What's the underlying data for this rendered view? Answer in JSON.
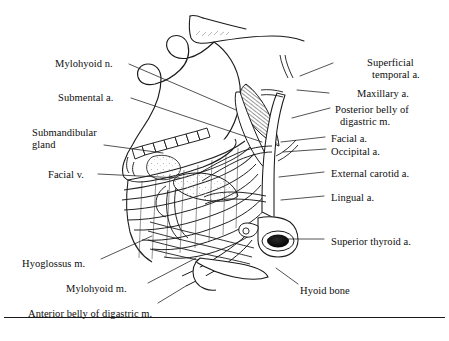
{
  "figure": {
    "kind": "anatomical-line-drawing",
    "region": "Submandibular and suprahyoid region, lateral view",
    "ink_color": "#101010",
    "background_color": "#ffffff"
  },
  "labels": {
    "left": [
      {
        "id": "mylohyoid-n",
        "text": "Mylohyoid n.",
        "x": 55,
        "y": 58,
        "lead": [
          [
            129,
            64
          ],
          [
            236,
            110
          ]
        ]
      },
      {
        "id": "submental-a",
        "text": "Submental a.",
        "x": 58,
        "y": 92,
        "lead": [
          [
            131,
            98
          ],
          [
            262,
            142
          ]
        ]
      },
      {
        "id": "submandibular-gland-l1",
        "text": "Submandibular",
        "x": 32,
        "y": 127,
        "lead": null
      },
      {
        "id": "submandibular-gland-l2",
        "text": "gland",
        "x": 32,
        "y": 139,
        "lead": [
          [
            104,
            145
          ],
          [
            163,
            153
          ]
        ]
      },
      {
        "id": "facial-v",
        "text": "Facial v.",
        "x": 48,
        "y": 169,
        "lead": [
          [
            98,
            174
          ],
          [
            180,
            178
          ]
        ]
      },
      {
        "id": "hyoglossus-m",
        "text": "Hyoglossus m.",
        "x": 22,
        "y": 258,
        "lead": [
          [
            101,
            259
          ],
          [
            152,
            236
          ]
        ]
      },
      {
        "id": "mylohyoid-m",
        "text": "Mylohyoid m.",
        "x": 66,
        "y": 283,
        "lead": [
          [
            148,
            283
          ],
          [
            196,
            258
          ]
        ]
      },
      {
        "id": "anterior-belly-digastric",
        "text": "Anterior belly of digastric m.",
        "x": 28,
        "y": 308,
        "lead": [
          [
            158,
            303
          ],
          [
            186,
            286
          ]
        ]
      }
    ],
    "right": [
      {
        "id": "superficial-temporal-a-l1",
        "text": "Superficial",
        "x": 367,
        "y": 57,
        "lead": [
          [
            333,
            63
          ],
          [
            300,
            76
          ]
        ]
      },
      {
        "id": "superficial-temporal-a-l2",
        "text": "temporal a.",
        "x": 372,
        "y": 69,
        "lead": null
      },
      {
        "id": "maxillary-a",
        "text": "Maxillary a.",
        "x": 357,
        "y": 88,
        "lead": [
          [
            329,
            93
          ],
          [
            297,
            90
          ]
        ]
      },
      {
        "id": "posterior-belly-l1",
        "text": "Posterior belly of",
        "x": 335,
        "y": 104,
        "lead": [
          [
            330,
            108
          ],
          [
            292,
            118
          ]
        ]
      },
      {
        "id": "posterior-belly-l2",
        "text": "digastric m.",
        "x": 340,
        "y": 116,
        "lead": null
      },
      {
        "id": "facial-a",
        "text": "Facial a.",
        "x": 331,
        "y": 133,
        "lead": [
          [
            325,
            137
          ],
          [
            281,
            142
          ]
        ]
      },
      {
        "id": "occipital-a",
        "text": "Occipital a.",
        "x": 331,
        "y": 146,
        "lead": [
          [
            326,
            149
          ],
          [
            283,
            152
          ]
        ]
      },
      {
        "id": "external-carotid-a",
        "text": "External carotid a.",
        "x": 331,
        "y": 168,
        "lead": [
          [
            324,
            172
          ],
          [
            279,
            177
          ]
        ]
      },
      {
        "id": "lingual-a",
        "text": "Lingual a.",
        "x": 331,
        "y": 192,
        "lead": [
          [
            324,
            196
          ],
          [
            281,
            200
          ]
        ]
      },
      {
        "id": "superior-thyroid-a",
        "text": "Superior thyroid a.",
        "x": 331,
        "y": 236,
        "lead": [
          [
            324,
            239
          ],
          [
            283,
            239
          ]
        ]
      },
      {
        "id": "hyoid-bone",
        "text": "Hyoid bone",
        "x": 300,
        "y": 285,
        "lead": [
          [
            298,
            284
          ],
          [
            276,
            268
          ]
        ]
      }
    ]
  }
}
